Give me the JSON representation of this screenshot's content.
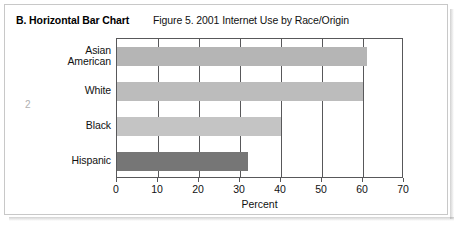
{
  "document": {
    "section_label": "B. Horizontal Bar Chart",
    "page_number": "2"
  },
  "chart_data": {
    "type": "bar",
    "orientation": "horizontal",
    "title": "Figure 5. 2001 Internet Use by Race/Origin",
    "xlabel": "Percent",
    "ylabel": "",
    "categories": [
      "Asian American",
      "White",
      "Black",
      "Hispanic"
    ],
    "values": [
      61,
      60,
      40,
      32
    ],
    "series": [
      {
        "name": "Internet Use",
        "values": [
          61,
          60,
          40,
          32
        ]
      }
    ],
    "bar_colors": [
      "#b5b5b5",
      "#bcbcbc",
      "#c4c4c4",
      "#767676"
    ],
    "xlim": [
      0,
      70
    ],
    "xticks": [
      0,
      10,
      20,
      30,
      40,
      50,
      60,
      70
    ],
    "xtick_labels": [
      "0",
      "10",
      "20",
      "30",
      "40",
      "50",
      "60",
      "70"
    ],
    "grid": "vertical",
    "legend": "none",
    "axis_color": "#58585a"
  }
}
